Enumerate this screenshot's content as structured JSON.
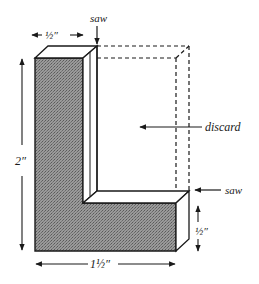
{
  "diagram": {
    "labels": {
      "saw_top": "saw",
      "saw_right": "saw",
      "discard": "discard",
      "width_top": "½″",
      "height_left": "2″",
      "width_bottom": "1½″",
      "height_right": "½″"
    },
    "colors": {
      "line": "#1a1a1a",
      "front_face_fill": "#8c8c8c",
      "background": "#ffffff"
    }
  }
}
